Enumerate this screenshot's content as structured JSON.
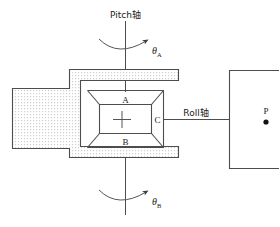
{
  "diagram": {
    "background_color": "#ffffff",
    "line_color": "#4d4d4d",
    "fill_pattern": "stipple-dots",
    "labels": {
      "pitch_axis": "Pitch轴",
      "roll_axis": "Roll轴",
      "theta_a_symbol": "θ",
      "theta_a_sub": "A",
      "theta_b_symbol": "θ",
      "theta_b_sub": "B",
      "node_a": "A",
      "node_b": "B",
      "node_c": "C",
      "point_p": "P"
    },
    "axes": [
      {
        "name": "pitch",
        "label": "Pitch轴",
        "orientation": "vertical",
        "rotation_symbol": "θ",
        "rotation_subscripts": [
          "A",
          "B"
        ]
      },
      {
        "name": "roll",
        "label": "Roll轴",
        "orientation": "horizontal",
        "attached_node": "C"
      }
    ],
    "nodes": [
      {
        "id": "A",
        "label": "A",
        "position": "top-inner-frame"
      },
      {
        "id": "B",
        "label": "B",
        "position": "bottom-inner-frame"
      },
      {
        "id": "C",
        "label": "C",
        "position": "right-inner-frame"
      },
      {
        "id": "P",
        "label": "P",
        "position": "right-bracket-interior",
        "marker": "filled-dot"
      }
    ],
    "center_marker": "plus-crosshair"
  }
}
